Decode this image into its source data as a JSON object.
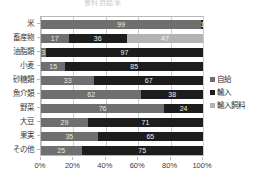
{
  "chart_data": {
    "type": "bar",
    "orientation": "horizontal",
    "stacked": "percent",
    "title": "食料自給率",
    "xlabel": "",
    "ylabel": "",
    "xlim": [
      0,
      100
    ],
    "grid": true,
    "legend_position": "right",
    "xticks": [
      "0%",
      "20%",
      "40%",
      "60%",
      "80%",
      "100%"
    ],
    "xtick_values": [
      0,
      20,
      40,
      60,
      80,
      100
    ],
    "categories": [
      "米",
      "畜産物",
      "油脂類",
      "小麦",
      "砂糖類",
      "魚介類",
      "野菜",
      "大豆",
      "果実",
      "その他"
    ],
    "series": [
      {
        "name": "自給",
        "color": "#6f6f6f",
        "values": [
          99,
          17,
          3,
          15,
          33,
          62,
          76,
          29,
          35,
          25
        ]
      },
      {
        "name": "輸入",
        "color": "#1d1d1d",
        "values": [
          1,
          36,
          97,
          85,
          67,
          38,
          24,
          71,
          65,
          75
        ]
      },
      {
        "name": "輸入飼料",
        "color": "#b3b3b3",
        "values": [
          0,
          47,
          0,
          0,
          0,
          0,
          0,
          0,
          0,
          0
        ]
      }
    ],
    "bars": [
      {
        "category": "米",
        "segments": [
          {
            "series": "自給",
            "value": 99,
            "label": "99"
          },
          {
            "series": "輸入",
            "value": 1,
            "label": "1"
          }
        ]
      },
      {
        "category": "畜産物",
        "segments": [
          {
            "series": "自給",
            "value": 17,
            "label": "17"
          },
          {
            "series": "輸入",
            "value": 36,
            "label": "36"
          },
          {
            "series": "輸入飼料",
            "value": 47,
            "label": "47"
          }
        ]
      },
      {
        "category": "油脂類",
        "segments": [
          {
            "series": "自給",
            "value": 3,
            "label": "3"
          },
          {
            "series": "輸入",
            "value": 97,
            "label": "97"
          }
        ]
      },
      {
        "category": "小麦",
        "segments": [
          {
            "series": "自給",
            "value": 15,
            "label": "15"
          },
          {
            "series": "輸入",
            "value": 85,
            "label": "85"
          }
        ]
      },
      {
        "category": "砂糖類",
        "segments": [
          {
            "series": "自給",
            "value": 33,
            "label": "33"
          },
          {
            "series": "輸入",
            "value": 67,
            "label": "67"
          }
        ]
      },
      {
        "category": "魚介類",
        "segments": [
          {
            "series": "自給",
            "value": 62,
            "label": "62"
          },
          {
            "series": "輸入",
            "value": 38,
            "label": "38"
          }
        ]
      },
      {
        "category": "野菜",
        "segments": [
          {
            "series": "自給",
            "value": 76,
            "label": "76"
          },
          {
            "series": "輸入",
            "value": 24,
            "label": "24"
          }
        ]
      },
      {
        "category": "大豆",
        "segments": [
          {
            "series": "自給",
            "value": 29,
            "label": "29"
          },
          {
            "series": "輸入",
            "value": 71,
            "label": "71"
          }
        ]
      },
      {
        "category": "果実",
        "segments": [
          {
            "series": "自給",
            "value": 35,
            "label": "35"
          },
          {
            "series": "輸入",
            "value": 65,
            "label": "65"
          }
        ]
      },
      {
        "category": "その他",
        "segments": [
          {
            "series": "自給",
            "value": 25,
            "label": "25"
          },
          {
            "series": "輸入",
            "value": 75,
            "label": "75"
          }
        ]
      }
    ]
  },
  "legend": {
    "items": [
      {
        "label": "自給",
        "color": "#6f6f6f"
      },
      {
        "label": "輸入",
        "color": "#1d1d1d"
      },
      {
        "label": "輸入飼料",
        "color": "#b3b3b3"
      }
    ]
  }
}
